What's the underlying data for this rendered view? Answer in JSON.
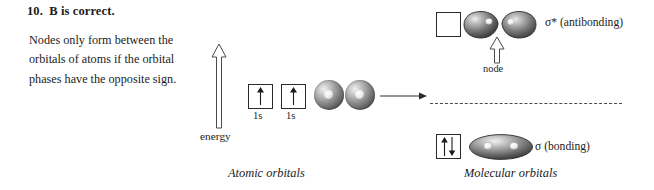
{
  "answer": {
    "heading": "10.  B is correct.",
    "explanation": "Nodes only form between the orbitals of atoms if the orbital phases have the opposite sign."
  },
  "diagram": {
    "energy_axis": {
      "label": "energy",
      "direction_icon": "up-arrow-icon"
    },
    "captions": {
      "atomic": "Atomic orbitals",
      "molecular": "Molecular orbitals"
    },
    "atomic_orbitals": {
      "boxes": [
        {
          "label": "1s",
          "electrons": "single",
          "spin_icon": "spin-up-arrow-icon"
        },
        {
          "label": "1s",
          "electrons": "single",
          "spin_icon": "spin-up-arrow-icon"
        }
      ],
      "spheres": [
        {
          "name": "s-orbital-sphere"
        },
        {
          "name": "s-orbital-sphere"
        }
      ]
    },
    "transition": {
      "icon": "right-arrow-icon"
    },
    "molecular_orbitals": {
      "antibonding": {
        "label": "σ* (antibonding)",
        "box_electrons": "empty",
        "lobes": 2
      },
      "bonding": {
        "label": "σ (bonding)",
        "box_electrons": "paired",
        "spin_icons": [
          "spin-up-arrow-icon",
          "spin-down-arrow-icon"
        ],
        "lobes": 1
      },
      "node": {
        "label": "node",
        "pointer_icon": "up-arrow-icon"
      }
    },
    "colors": {
      "ink": "#1c1c1c",
      "outline": "#2a2a2a",
      "orbital_dark": "#3a3a3a",
      "orbital_light": "#f2f2f2",
      "level_line": "#4b4b4b"
    }
  }
}
